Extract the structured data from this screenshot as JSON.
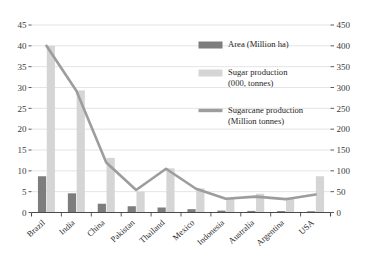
{
  "chart_data": {
    "type": "bar",
    "title": "",
    "subtitle": "",
    "xlabel": "",
    "ylabel": "",
    "y2label": "",
    "categories": [
      "Brazil",
      "India",
      "China",
      "Pakistan",
      "Thailand",
      "Mexico",
      "Indonesia",
      "Australia",
      "Argentina",
      "USA"
    ],
    "series": [
      {
        "name": "Area (Million ha)",
        "type": "bar",
        "axis": "left",
        "color": "#7d7d7d",
        "values": [
          8.7,
          4.6,
          2.1,
          1.5,
          1.2,
          0.8,
          0.45,
          0.38,
          0.35,
          0.3
        ]
      },
      {
        "name": "Sugar production (000, tonnes)",
        "type": "bar",
        "axis": "left",
        "color": "#d5d5d5",
        "values": [
          40.0,
          29.3,
          13.1,
          5.0,
          10.6,
          5.8,
          3.4,
          4.5,
          3.6,
          8.7
        ]
      },
      {
        "name": "Sugarcane production (Million tonnes)",
        "type": "line",
        "axis": "right",
        "color": "#9d9d9d",
        "values": [
          400,
          292,
          120,
          54,
          105,
          57,
          33,
          38,
          32,
          43
        ]
      }
    ],
    "ylim": [
      0,
      45
    ],
    "yticks": [
      "0",
      "5",
      "10",
      "15",
      "20",
      "25",
      "30",
      "35",
      "40",
      "45"
    ],
    "y2lim": [
      0,
      450
    ],
    "y2ticks": [
      "0",
      "50",
      "100",
      "150",
      "200",
      "250",
      "300",
      "350",
      "400",
      "450"
    ],
    "grid": true,
    "legend_position": "upper-center",
    "legend": [
      {
        "label": "Area (Million ha)",
        "marker": "bar",
        "color": "#7d7d7d"
      },
      {
        "label": "Sugar production",
        "label2": "(000, tonnes)",
        "marker": "bar",
        "color": "#d5d5d5"
      },
      {
        "label": "Sugarcane production",
        "label2": "(Million tonnes)",
        "marker": "line",
        "color": "#9d9d9d"
      }
    ]
  }
}
